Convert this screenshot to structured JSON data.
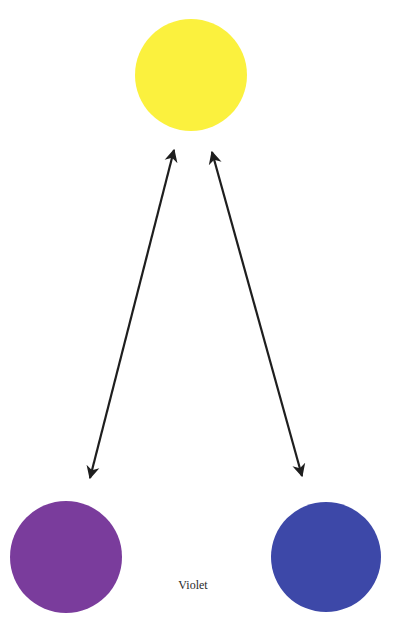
{
  "diagram": {
    "nodes": [
      {
        "id": "yellow",
        "color_name": "Yellow",
        "fill": "#fbf13e"
      },
      {
        "id": "violet",
        "color_name": "Violet",
        "fill": "#7a3c9c"
      },
      {
        "id": "blue",
        "color_name": "Blue",
        "fill": "#3d48a8"
      }
    ],
    "edges": [
      {
        "from": "yellow",
        "to": "violet",
        "type": "double-arrow"
      },
      {
        "from": "yellow",
        "to": "blue",
        "type": "double-arrow"
      }
    ],
    "arrow_color": "#1e1e1e",
    "label": "Violet"
  }
}
